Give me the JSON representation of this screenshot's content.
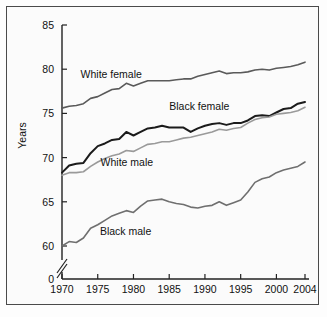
{
  "figure": {
    "frame_color": "#4a4a4a",
    "background": "#fbfbfb"
  },
  "axis": {
    "y_title": "Years",
    "y_ticklabels": [
      "85",
      "80",
      "75",
      "70",
      "65",
      "60",
      "0"
    ],
    "x_ticklabels": [
      "1970",
      "1975",
      "1980",
      "1985",
      "1990",
      "1995",
      "2000",
      "2004"
    ],
    "y_axis_break": "//"
  },
  "series_labels": {
    "white_female": "White female",
    "black_female": "Black female",
    "white_male": "White male",
    "black_male": "Black male"
  },
  "chart_data": {
    "type": "line",
    "title": "",
    "xlabel": "",
    "ylabel": "Years",
    "xlim": [
      1970,
      2004
    ],
    "ylim": [
      57.5,
      85
    ],
    "y_ticks": [
      60,
      65,
      70,
      75,
      80,
      85
    ],
    "x_ticks": [
      1970,
      1975,
      1980,
      1985,
      1990,
      1995,
      2000,
      2004
    ],
    "grid": false,
    "legend": "inline-labels",
    "axis_break": {
      "axis": "y",
      "between": [
        0,
        60
      ]
    },
    "x": [
      1970,
      1971,
      1972,
      1973,
      1974,
      1975,
      1976,
      1977,
      1978,
      1979,
      1980,
      1981,
      1982,
      1983,
      1984,
      1985,
      1986,
      1987,
      1988,
      1989,
      1990,
      1991,
      1992,
      1993,
      1994,
      1995,
      1996,
      1997,
      1998,
      1999,
      2000,
      2001,
      2002,
      2003,
      2004
    ],
    "series": [
      {
        "name": "White female",
        "color": "#5a5a5a",
        "width": 1.6,
        "values": [
          75.6,
          75.8,
          75.9,
          76.1,
          76.7,
          76.9,
          77.3,
          77.7,
          77.8,
          78.4,
          78.1,
          78.4,
          78.7,
          78.7,
          78.7,
          78.7,
          78.8,
          78.9,
          78.9,
          79.2,
          79.4,
          79.6,
          79.8,
          79.5,
          79.6,
          79.6,
          79.7,
          79.9,
          80.0,
          79.9,
          80.1,
          80.2,
          80.3,
          80.5,
          80.8
        ]
      },
      {
        "name": "Black female",
        "color": "#1b1b1b",
        "width": 2.0,
        "values": [
          68.3,
          69.1,
          69.3,
          69.4,
          70.5,
          71.3,
          71.6,
          72.0,
          72.1,
          72.9,
          72.5,
          72.9,
          73.3,
          73.4,
          73.6,
          73.4,
          73.4,
          73.4,
          72.9,
          73.3,
          73.6,
          73.8,
          73.9,
          73.7,
          73.9,
          73.9,
          74.2,
          74.7,
          74.8,
          74.7,
          75.1,
          75.5,
          75.6,
          76.1,
          76.3
        ]
      },
      {
        "name": "White male",
        "color": "#9a9a9a",
        "width": 1.6,
        "values": [
          68.0,
          68.3,
          68.3,
          68.4,
          69.0,
          69.5,
          69.9,
          70.2,
          70.4,
          70.8,
          70.7,
          71.1,
          71.5,
          71.6,
          71.8,
          71.8,
          72.0,
          72.2,
          72.3,
          72.5,
          72.7,
          72.9,
          73.2,
          73.1,
          73.3,
          73.4,
          73.9,
          74.3,
          74.5,
          74.6,
          74.9,
          75.0,
          75.1,
          75.3,
          75.7
        ]
      },
      {
        "name": "Black male",
        "color": "#6f6f6f",
        "width": 1.6,
        "values": [
          60.0,
          60.5,
          60.4,
          60.9,
          62.0,
          62.4,
          62.9,
          63.4,
          63.7,
          64.0,
          63.8,
          64.5,
          65.1,
          65.2,
          65.3,
          65.0,
          64.8,
          64.7,
          64.4,
          64.3,
          64.5,
          64.6,
          65.0,
          64.6,
          64.9,
          65.2,
          66.1,
          67.2,
          67.6,
          67.8,
          68.3,
          68.6,
          68.8,
          69.0,
          69.5
        ]
      }
    ],
    "series_label_positions": [
      {
        "name": "White female",
        "x": 1972.6,
        "y": 79.0
      },
      {
        "name": "Black female",
        "x": 1985.0,
        "y": 75.4
      },
      {
        "name": "White male",
        "x": 1975.4,
        "y": 69.1
      },
      {
        "name": "Black male",
        "x": 1975.3,
        "y": 61.3
      }
    ]
  }
}
